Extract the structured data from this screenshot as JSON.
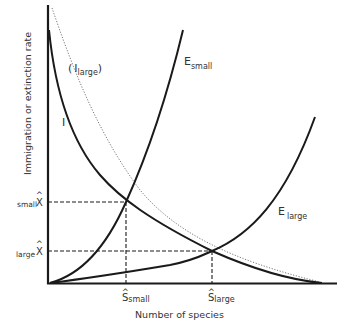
{
  "diagram": {
    "title": "",
    "y_axis_label": "Immigration or extinction rate",
    "x_axis_label": "Number of species",
    "curves": {
      "immigration": {
        "label": "I"
      },
      "immigration_large": {
        "label_open": "(",
        "label_main": "I",
        "label_sub": "large",
        "label_close": ")"
      },
      "extinction_small": {
        "label_main": "E",
        "label_sub": "small"
      },
      "extinction_large": {
        "label_main": "E",
        "label_sub": "large"
      }
    },
    "equilibria": {
      "s_small": {
        "main": "S",
        "hat": "^",
        "sub": "small"
      },
      "s_large": {
        "main": "S",
        "hat": "^",
        "sub": "large"
      },
      "x_small": {
        "prefix": "small",
        "main": "X",
        "hat": "^"
      },
      "x_large": {
        "prefix": "large",
        "main": "X",
        "hat": "^"
      }
    },
    "colors": {
      "line": "#1a1a1a",
      "dotted": "#777777",
      "text": "#333333",
      "background": "#ffffff"
    }
  }
}
